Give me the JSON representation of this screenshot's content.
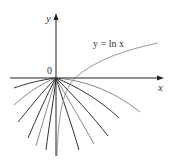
{
  "figure": {
    "axis_labels": {
      "x": "x",
      "y": "y"
    },
    "origin_label": "0",
    "curve_label": "y = ln x",
    "colors": {
      "axes": "#222222",
      "family": "#333333",
      "family_light": "#888888",
      "ln_curve": "#999999"
    }
  },
  "curves": {
    "ln": "M57,156 C58,120 62,90 75,78 C95,60 125,50 158,43",
    "family": [
      "M56,78 C40,80 25,84 14,88",
      "M56,78 C40,84 25,95 14,105",
      "M56,78 C42,92 28,110 18,122",
      "M56,78 C46,96 36,120 28,138",
      "M56,78 C50,98 42,125 36,146",
      "M56,78 C54,98 49,125 46,150",
      "M56,78 C62,98 72,125 79,150",
      "M56,78 C66,96 82,122 94,144",
      "M56,78 C70,92 92,115 108,136",
      "M56,78 C76,86 100,100 119,118",
      "M56,78 C80,80 110,88 140,112"
    ]
  }
}
